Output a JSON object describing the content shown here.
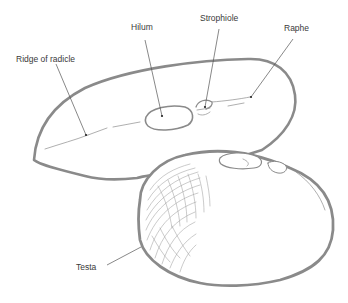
{
  "diagram": {
    "subjects": [
      "back-seed-side-view",
      "front-seed"
    ],
    "labels": [
      {
        "id": "ridge",
        "text": "Ridge of radicle",
        "x": 16,
        "y": 55
      },
      {
        "id": "hilum",
        "text": "Hilum",
        "x": 131,
        "y": 23
      },
      {
        "id": "strophiole",
        "text": "Strophiole",
        "x": 200,
        "y": 14
      },
      {
        "id": "raphe",
        "text": "Raphe",
        "x": 284,
        "y": 24
      },
      {
        "id": "testa",
        "text": "Testa",
        "x": 76,
        "y": 263
      }
    ],
    "colors": {
      "outline": "#8a8a8a",
      "text": "#3a3a3a",
      "leader": "#555555",
      "background": "#ffffff"
    }
  }
}
